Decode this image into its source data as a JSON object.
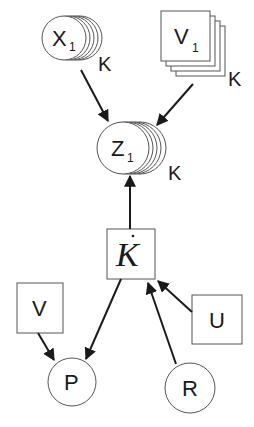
{
  "diagram": {
    "type": "graphical-model",
    "background": "#ffffff",
    "line_color": "#1a1a1a",
    "nodes": {
      "x1": {
        "label": "X",
        "subscript": "1",
        "shape": "stacked-circle",
        "plate": "K"
      },
      "v1": {
        "label": "V",
        "subscript": "1",
        "shape": "stacked-square",
        "plate": "K"
      },
      "z1": {
        "label": "Z",
        "subscript": "1",
        "shape": "stacked-circle",
        "plate": "K"
      },
      "kdot": {
        "label": "K",
        "accent": "̇",
        "shape": "square",
        "style": "italic-serif"
      },
      "v": {
        "label": "V",
        "shape": "square"
      },
      "u": {
        "label": "U",
        "shape": "square"
      },
      "p": {
        "label": "P",
        "shape": "circle"
      },
      "r": {
        "label": "R",
        "shape": "circle"
      }
    },
    "edges": [
      {
        "from": "X1",
        "to": "Z1"
      },
      {
        "from": "V1",
        "to": "Z1"
      },
      {
        "from": "K̇",
        "to": "Z1"
      },
      {
        "from": "U",
        "to": "K̇"
      },
      {
        "from": "R",
        "to": "K̇"
      },
      {
        "from": "K̇",
        "to": "P"
      },
      {
        "from": "V",
        "to": "P"
      }
    ]
  }
}
